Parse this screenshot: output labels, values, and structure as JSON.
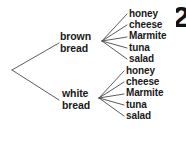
{
  "diagram": {
    "type": "probability-tree",
    "root": {
      "name": "root-node",
      "x": 12,
      "y": 70
    },
    "line_color": "#4a4a4a",
    "text_color": "#1a1a1a",
    "background_color": "#ffffff",
    "branches": [
      {
        "id": "brown-bread",
        "label_line1": "brown",
        "label_line2": "bread",
        "label_x": 60,
        "label_y": 31,
        "junction_x": 102,
        "junction_y": 41,
        "fillings": [
          {
            "label": "honey",
            "x": 129,
            "y": 8
          },
          {
            "label": "cheese",
            "x": 129,
            "y": 19
          },
          {
            "label": "Marmite",
            "x": 129,
            "y": 30
          },
          {
            "label": "tuna",
            "x": 129,
            "y": 42
          },
          {
            "label": "salad",
            "x": 129,
            "y": 53
          }
        ]
      },
      {
        "id": "white-bread",
        "label_line1": "white",
        "label_line2": "bread",
        "label_x": 62,
        "label_y": 88,
        "junction_x": 99,
        "junction_y": 98,
        "fillings": [
          {
            "label": "honey",
            "x": 126,
            "y": 65
          },
          {
            "label": "cheese",
            "x": 126,
            "y": 76
          },
          {
            "label": "Marmite",
            "x": 126,
            "y": 87
          },
          {
            "label": "tuna",
            "x": 126,
            "y": 99
          },
          {
            "label": "salad",
            "x": 126,
            "y": 110
          }
        ]
      }
    ],
    "corner_mark": "2"
  }
}
